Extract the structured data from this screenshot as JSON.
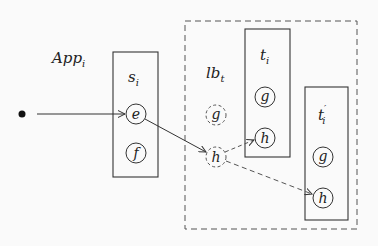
{
  "diagram": {
    "app_label": {
      "base": "App",
      "sub": "i"
    },
    "lb_label": {
      "base": "lb",
      "sub": "t"
    },
    "boxes": [
      {
        "id": "s_i",
        "base": "s",
        "sub": "i",
        "prime": ""
      },
      {
        "id": "t_i",
        "base": "t",
        "sub": "i",
        "prime": ""
      },
      {
        "id": "t_prime_i",
        "base": "t",
        "sub": "i",
        "prime": "′"
      }
    ],
    "nodes": {
      "s_e": "e",
      "s_f": "f",
      "lb_g": "g",
      "lb_h": "h",
      "t_g": "g",
      "t_h": "h",
      "tp_g": "g",
      "tp_h": "h"
    },
    "colors": {
      "stroke": "#333333",
      "dashed": "#555555",
      "background": "#fafafa"
    }
  }
}
